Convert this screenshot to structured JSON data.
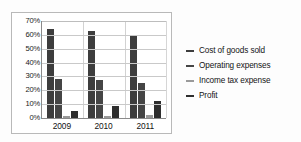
{
  "chart_data": {
    "type": "bar",
    "title": "",
    "xlabel": "",
    "ylabel": "",
    "categories": [
      "2009",
      "2010",
      "2011"
    ],
    "ylim": [
      0,
      70
    ],
    "ytick_labels": [
      "70%",
      "60%",
      "50%",
      "40%",
      "30%",
      "20%",
      "10%",
      "0%"
    ],
    "ytick_values": [
      70,
      60,
      50,
      40,
      30,
      20,
      10,
      0
    ],
    "grid": true,
    "legend_position": "right",
    "series": [
      {
        "name": "Cost of goods sold",
        "color": "#3d3d3d",
        "values": [
          64,
          62.5,
          59
        ]
      },
      {
        "name": "Operating expenses",
        "color": "#454545",
        "values": [
          28.5,
          27.5,
          25
        ]
      },
      {
        "name": "Income tax expense",
        "color": "#9a9a9a",
        "values": [
          1.5,
          1.5,
          2
        ]
      },
      {
        "name": "Profit",
        "color": "#2e2e2e",
        "values": [
          5,
          9,
          12
        ]
      }
    ]
  },
  "legend": {
    "items": [
      {
        "label": "Cost of goods sold"
      },
      {
        "label": "Operating expenses"
      },
      {
        "label": "Income tax expense"
      },
      {
        "label": "Profit"
      }
    ]
  }
}
